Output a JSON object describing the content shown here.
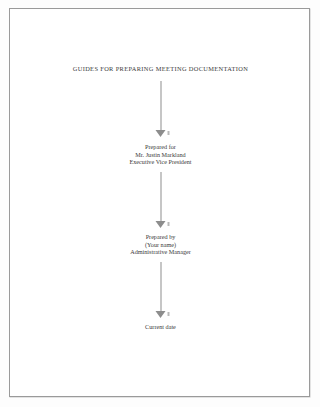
{
  "document": {
    "title": "GUIDES FOR PREPARING MEETING DOCUMENTATION",
    "blocks": [
      {
        "name": "prepared-for-block",
        "lines": [
          "Prepared for",
          "Mr. Justin Markland",
          "Executive Vice President"
        ]
      },
      {
        "name": "prepared-by-block",
        "lines": [
          "Prepared by",
          "(Your name)",
          "Administrative Manager"
        ]
      },
      {
        "name": "date-block",
        "lines": [
          "Current date"
        ]
      }
    ],
    "colors": {
      "page_background": "#ffffff",
      "page_border": "#9a9a9a",
      "text": "#3a3a3a",
      "arrow": "#8d8d8d"
    }
  }
}
